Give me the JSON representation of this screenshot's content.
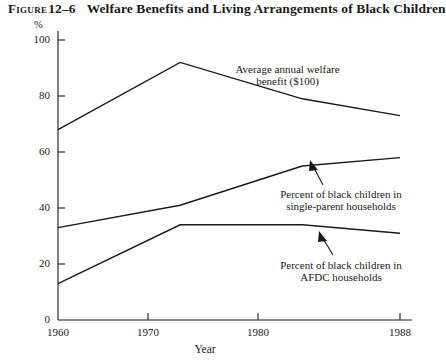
{
  "figure": {
    "label": "Figure",
    "number": "12–6",
    "caption": "Welfare Benefits and Living Arrangements of Black Children"
  },
  "chart_data": {
    "type": "line",
    "title": "Welfare Benefits and Living Arrangements of Black Children",
    "xlabel": "Year",
    "ylabel": "%",
    "x": [
      1960,
      1970,
      1980,
      1988
    ],
    "xlim": [
      1960,
      1988
    ],
    "ylim": [
      0,
      100
    ],
    "xticks": [
      "1960",
      "1970",
      "1980",
      "1988"
    ],
    "yticks": [
      "0",
      "20",
      "40",
      "60",
      "80",
      "100"
    ],
    "grid": false,
    "legend": "annotations-inline",
    "series": [
      {
        "name": "Average annual welfare benefit ($100)",
        "values": [
          68,
          92,
          79,
          73
        ]
      },
      {
        "name": "Percent of black children in single-parent households",
        "values": [
          33,
          41,
          55,
          58
        ]
      },
      {
        "name": "Percent of black children in AFDC households",
        "values": [
          13,
          34,
          34,
          31
        ]
      }
    ],
    "annotations": [
      {
        "id": "welfare-benefit",
        "line1": "Average annual welfare",
        "line2": "benefit ($100)"
      },
      {
        "id": "single-parent",
        "line1": "Percent of black children in",
        "line2": "single-parent households"
      },
      {
        "id": "afdc",
        "line1": "Percent of black children in",
        "line2": "AFDC households"
      }
    ]
  }
}
